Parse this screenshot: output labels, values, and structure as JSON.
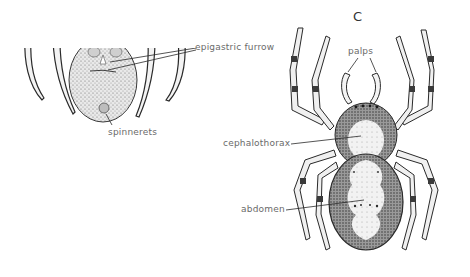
{
  "figure": {
    "panel_letter": "C",
    "ventral_view": {
      "labels": {
        "epigastric_furrow": "epigastric furrow",
        "spinnerets": "spinnerets"
      }
    },
    "dorsal_view": {
      "labels": {
        "palps": "palps",
        "cephalothorax": "cephalothorax",
        "abdomen": "abdomen"
      }
    }
  },
  "colors": {
    "background": "#ffffff",
    "ink": "#2a2a2a",
    "label_text": "#6a6a6a",
    "stipple_light": "#d8d8d8",
    "stipple_dark": "#5a5a5a"
  }
}
